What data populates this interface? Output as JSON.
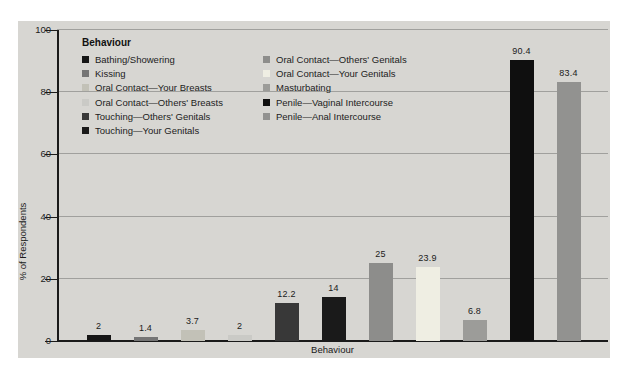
{
  "chart_data": {
    "type": "bar",
    "title": "",
    "xlabel": "Behaviour",
    "ylabel": "% of Respondents",
    "ylim": [
      0,
      100
    ],
    "yticks": [
      0,
      20,
      40,
      60,
      80,
      100
    ],
    "grid": true,
    "legend_title": "Behaviour",
    "legend_position": "upper-left-inside",
    "categories": [
      "Bathing/Showering",
      "Kissing",
      "Oral Contact—Your Breasts",
      "Oral Contact—Others' Breasts",
      "Touching—Others' Genitals",
      "Touching—Your Genitals",
      "Oral Contact—Others' Genitals",
      "Oral Contact—Your Genitals",
      "Masturbating",
      "Penile—Vaginal Intercourse",
      "Penile—Anal Intercourse"
    ],
    "values": [
      2,
      1.4,
      3.7,
      2,
      12.2,
      14,
      25,
      23.9,
      6.8,
      90.4,
      83.4
    ],
    "value_labels": [
      "2",
      "1.4",
      "3.7",
      "2",
      "12.2",
      "14",
      "25",
      "23.9",
      "6.8",
      "90.4",
      "83.4"
    ],
    "bar_colors": [
      "#161616",
      "#757575",
      "#c2c1b7",
      "#cacac6",
      "#383838",
      "#1a1a1a",
      "#8d8d8b",
      "#efeee3",
      "#9c9c99",
      "#0f0f0f",
      "#929290"
    ],
    "legend_column_split": 6
  },
  "colors": {
    "page_bg": "#ffffff",
    "panel_bg": "#d7d6d2",
    "gridline": "#a0a09d",
    "axis": "#1a1a1a",
    "text": "#1a1a1a"
  }
}
